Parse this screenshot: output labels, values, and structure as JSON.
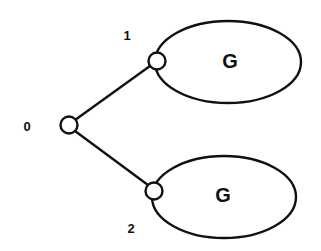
{
  "diagram": {
    "type": "tree",
    "nodes": [
      {
        "id": "0",
        "label": "0"
      },
      {
        "id": "1",
        "label": "1"
      },
      {
        "id": "2",
        "label": "2"
      }
    ],
    "edges": [
      {
        "from": "0",
        "to": "1"
      },
      {
        "from": "0",
        "to": "2"
      }
    ],
    "subgraphs": [
      {
        "attached_to": "1",
        "label": "G"
      },
      {
        "attached_to": "2",
        "label": "G"
      }
    ]
  }
}
